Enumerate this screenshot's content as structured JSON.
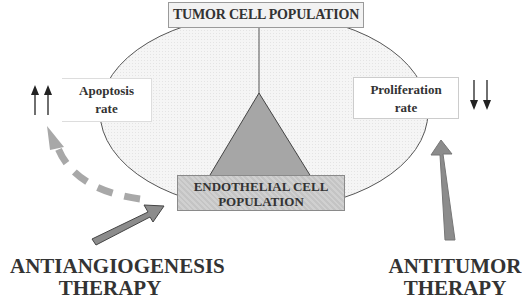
{
  "boxes": {
    "tumor_cell_population": "TUMOR CELL POPULATION",
    "endothelial_line1": "ENDOTHELIAL CELL",
    "endothelial_line2": "POPULATION",
    "apoptosis_line1": "Apoptosis",
    "apoptosis_line2": "rate",
    "proliferation_line1": "Proliferation",
    "proliferation_line2": "rate"
  },
  "therapies": {
    "antiangiogenesis_line1": "ANTIANGIOGENESIS",
    "antiangiogenesis_line2": "THERAPY",
    "antitumor_line1": "ANTITUMOR",
    "antitumor_line2": "THERAPY"
  },
  "indicators": {
    "apoptosis_direction": "up-up",
    "proliferation_direction": "down-down"
  },
  "colors": {
    "ellipse_fill": "#f4f4f4",
    "triangle_fill": "#a6a6a6",
    "arrow_fill": "#8c8c8c",
    "dashed_arrow": "#a8a8a8",
    "text": "#333333"
  }
}
